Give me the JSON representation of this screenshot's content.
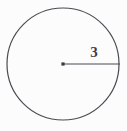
{
  "figure": {
    "kind": "geometry-diagram",
    "background_color": "#fcfcfc",
    "stroke_color": "#4a4a52",
    "label_color": "#3f3f47",
    "circle": {
      "name": "circle-outline",
      "center_x": 63,
      "center_y": 64,
      "radius": 56,
      "stroke_width": 1.2,
      "fill": "none"
    },
    "center_point": {
      "name": "center-dot",
      "x": 63,
      "y": 64,
      "size": 3.2
    },
    "radius_segment": {
      "name": "radius-line",
      "x1": 63,
      "y1": 64,
      "x2": 120,
      "y2": 64,
      "stroke_width": 1.2
    },
    "labels": [
      {
        "name": "radius-length-label",
        "text": "3",
        "x": 94,
        "y": 53
      }
    ]
  }
}
